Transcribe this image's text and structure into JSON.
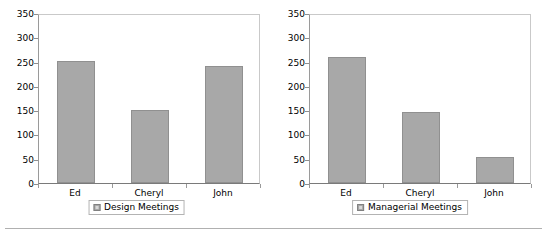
{
  "page": {
    "bottom_rule": true,
    "background_color": "#ffffff"
  },
  "style": {
    "bar_color": "#a8a8a8",
    "bar_border_color": "#909090",
    "axis_color": "#7a7a7a",
    "plot_border_color": "#c9c9c9"
  },
  "chart_data": [
    {
      "type": "bar",
      "title": "",
      "subtitle": "",
      "categories": [
        "Ed",
        "Cheryl",
        "John"
      ],
      "values": [
        255,
        152,
        244
      ],
      "series": [
        {
          "name": "Design Meetings",
          "values": [
            255,
            152,
            244
          ]
        }
      ],
      "legend": [
        "Design Meetings"
      ],
      "legend_position": "bottom",
      "xlabel": "",
      "ylabel": "",
      "ylim": [
        0,
        350
      ],
      "yticks": [
        0,
        50,
        100,
        150,
        200,
        250,
        300,
        350
      ],
      "ytick_labels": [
        "0",
        "50",
        "100",
        "150",
        "200",
        "250",
        "300",
        "350"
      ],
      "grid": false,
      "legend_swatch_icon": "square-swatch-icon"
    },
    {
      "type": "bar",
      "title": "",
      "subtitle": "",
      "categories": [
        "Ed",
        "Cheryl",
        "John"
      ],
      "values": [
        262,
        148,
        55
      ],
      "series": [
        {
          "name": "Managerial Meetings",
          "values": [
            262,
            148,
            55
          ]
        }
      ],
      "legend": [
        "Managerial Meetings"
      ],
      "legend_position": "bottom",
      "xlabel": "",
      "ylabel": "",
      "ylim": [
        0,
        350
      ],
      "yticks": [
        0,
        50,
        100,
        150,
        200,
        250,
        300,
        350
      ],
      "ytick_labels": [
        "0",
        "50",
        "100",
        "150",
        "200",
        "250",
        "300",
        "350"
      ],
      "grid": false,
      "legend_swatch_icon": "square-swatch-icon"
    }
  ]
}
